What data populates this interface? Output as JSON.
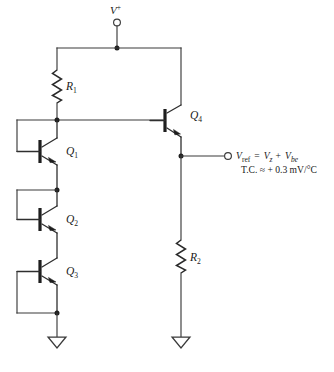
{
  "diagram": {
    "supply": {
      "label": "V",
      "superscript": "+",
      "terminal_icon": "open-circle-terminal"
    },
    "components": {
      "r1": {
        "name": "R",
        "subscript": "1",
        "type": "resistor"
      },
      "r2": {
        "name": "R",
        "subscript": "2",
        "type": "resistor"
      },
      "q1": {
        "name": "Q",
        "subscript": "1",
        "type": "npn-transistor"
      },
      "q2": {
        "name": "Q",
        "subscript": "2",
        "type": "npn-transistor"
      },
      "q3": {
        "name": "Q",
        "subscript": "3",
        "type": "npn-transistor"
      },
      "q4": {
        "name": "Q",
        "subscript": "4",
        "type": "npn-transistor"
      }
    },
    "output": {
      "terminal_icon": "open-circle-terminal",
      "equation": {
        "lhs_symbol": "V",
        "lhs_subscript": "ref",
        "equals": "=",
        "term1_symbol": "V",
        "term1_subscript": "z",
        "plus": "+",
        "term2_symbol": "V",
        "term2_subscript": "be"
      },
      "tempco": "T.C. ≈ + 0.3 mV/°C"
    },
    "grounds": [
      {
        "name": "ground-left",
        "icon": "triangle-ground"
      },
      {
        "name": "ground-right",
        "icon": "triangle-ground"
      }
    ],
    "colors": {
      "wire": "#3a3a3a",
      "node": "#1e1e1e",
      "text": "#1a1a1a",
      "background": "#ffffff"
    }
  }
}
